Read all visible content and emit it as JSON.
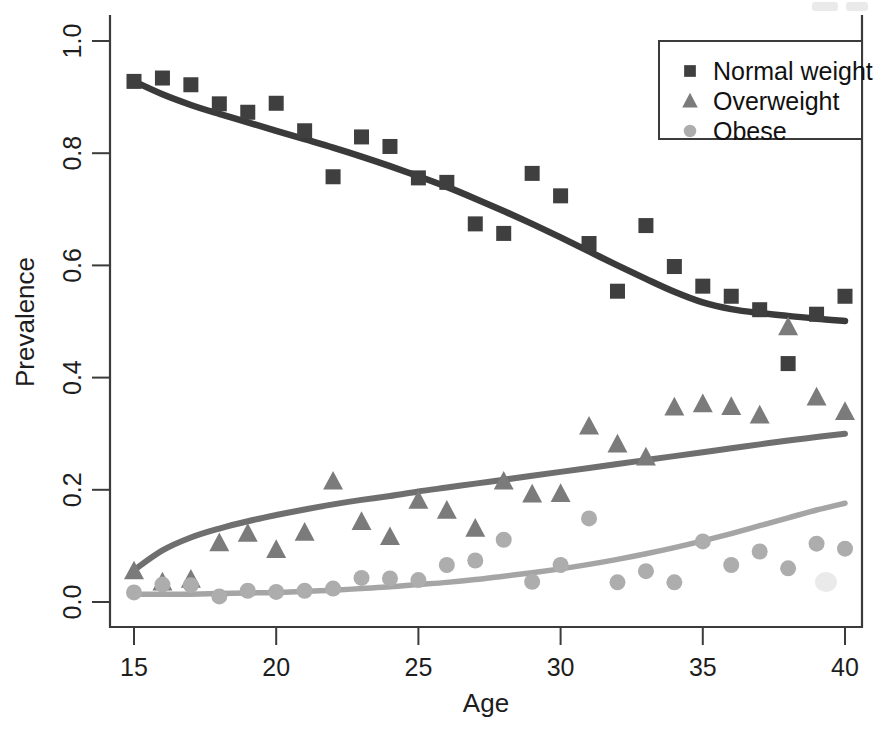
{
  "chart_data": {
    "type": "scatter",
    "title": "",
    "subtitle": "",
    "xlabel": "Age",
    "ylabel": "Prevalence",
    "xlim": [
      14.2,
      40.6
    ],
    "ylim": [
      -0.035,
      1.04
    ],
    "xticks": [
      15,
      20,
      25,
      30,
      35,
      40
    ],
    "xtick_labels": [
      "15",
      "20",
      "25",
      "30",
      "35",
      "40"
    ],
    "yticks": [
      0.0,
      0.2,
      0.4,
      0.6,
      0.8,
      1.0
    ],
    "ytick_labels": [
      "0.0",
      "0.2",
      "0.4",
      "0.6",
      "0.8",
      "1.0"
    ],
    "grid": false,
    "legend_position": "top-right",
    "series": [
      {
        "name": "Normal weight",
        "marker": "square",
        "color": "#3f3f3f",
        "line_color": "#3a3a3a",
        "x": [
          15,
          16,
          17,
          18,
          19,
          20,
          21,
          22,
          23,
          24,
          25,
          26,
          27,
          28,
          29,
          30,
          31,
          32,
          33,
          34,
          35,
          36,
          37,
          38,
          39,
          40
        ],
        "y": [
          0.928,
          0.934,
          0.922,
          0.888,
          0.873,
          0.889,
          0.84,
          0.758,
          0.829,
          0.812,
          0.756,
          0.748,
          0.674,
          0.657,
          0.764,
          0.724,
          0.639,
          0.554,
          0.671,
          0.598,
          0.563,
          0.545,
          0.521,
          0.425,
          0.513,
          0.545
        ],
        "fit_x": [
          15,
          16,
          17,
          18,
          19,
          20,
          21,
          22,
          23,
          24,
          25,
          26,
          27,
          28,
          29,
          30,
          31,
          32,
          33,
          34,
          35,
          36,
          37,
          38,
          39,
          40
        ],
        "fit_y": [
          0.928,
          0.905,
          0.886,
          0.87,
          0.855,
          0.84,
          0.825,
          0.81,
          0.794,
          0.777,
          0.759,
          0.74,
          0.719,
          0.697,
          0.674,
          0.65,
          0.625,
          0.6,
          0.576,
          0.553,
          0.534,
          0.522,
          0.515,
          0.51,
          0.505,
          0.501
        ]
      },
      {
        "name": "Overweight",
        "marker": "triangle",
        "color": "#7b7b7b",
        "line_color": "#6f6f6f",
        "x": [
          15,
          16,
          17,
          18,
          19,
          20,
          21,
          22,
          23,
          24,
          25,
          26,
          27,
          28,
          29,
          30,
          31,
          32,
          33,
          34,
          35,
          36,
          37,
          38,
          39,
          40
        ],
        "y": [
          0.055,
          0.035,
          0.04,
          0.105,
          0.122,
          0.093,
          0.124,
          0.215,
          0.143,
          0.116,
          0.181,
          0.163,
          0.131,
          0.215,
          0.192,
          0.193,
          0.313,
          0.281,
          0.258,
          0.347,
          0.353,
          0.348,
          0.333,
          0.49,
          0.365,
          0.339
        ],
        "fit_x": [
          15,
          16,
          17,
          18,
          19,
          20,
          21,
          22,
          23,
          24,
          25,
          26,
          27,
          28,
          29,
          30,
          31,
          32,
          33,
          34,
          35,
          36,
          37,
          38,
          39,
          40
        ],
        "fit_y": [
          0.057,
          0.092,
          0.115,
          0.131,
          0.144,
          0.155,
          0.165,
          0.174,
          0.182,
          0.189,
          0.197,
          0.204,
          0.211,
          0.218,
          0.225,
          0.232,
          0.239,
          0.246,
          0.253,
          0.26,
          0.267,
          0.274,
          0.281,
          0.288,
          0.294,
          0.3
        ]
      },
      {
        "name": "Obese",
        "marker": "circle",
        "color": "#adadad",
        "line_color": "#a5a5a5",
        "x": [
          15,
          16,
          17,
          18,
          19,
          20,
          21,
          22,
          23,
          24,
          25,
          26,
          27,
          28,
          29,
          30,
          31,
          32,
          33,
          34,
          35,
          36,
          37,
          38,
          39,
          40
        ],
        "y": [
          0.017,
          0.031,
          0.03,
          0.01,
          0.02,
          0.018,
          0.02,
          0.024,
          0.043,
          0.042,
          0.039,
          0.066,
          0.074,
          0.111,
          0.036,
          0.066,
          0.149,
          0.035,
          0.055,
          0.035,
          0.108,
          0.066,
          0.09,
          0.06,
          0.104,
          0.095
        ],
        "fit_x": [
          15,
          16,
          17,
          18,
          19,
          20,
          21,
          22,
          23,
          24,
          25,
          26,
          27,
          28,
          29,
          30,
          31,
          32,
          33,
          34,
          35,
          36,
          37,
          38,
          39,
          40
        ],
        "fit_y": [
          0.014,
          0.014,
          0.014,
          0.015,
          0.016,
          0.017,
          0.019,
          0.021,
          0.024,
          0.027,
          0.031,
          0.035,
          0.04,
          0.046,
          0.052,
          0.059,
          0.067,
          0.076,
          0.086,
          0.097,
          0.109,
          0.122,
          0.136,
          0.15,
          0.164,
          0.176
        ]
      }
    ]
  },
  "legend": {
    "items": [
      {
        "label": "Normal weight",
        "marker": "square",
        "color": "#3f3f3f"
      },
      {
        "label": "Overweight",
        "marker": "triangle",
        "color": "#7b7b7b"
      },
      {
        "label": "Obese",
        "marker": "circle",
        "color": "#adadad"
      }
    ]
  },
  "colors": {
    "background": "#ffffff",
    "axis": "#3b3b3b",
    "normal_weight": "#3f3f3f",
    "overweight": "#7b7b7b",
    "obese": "#adadad"
  }
}
